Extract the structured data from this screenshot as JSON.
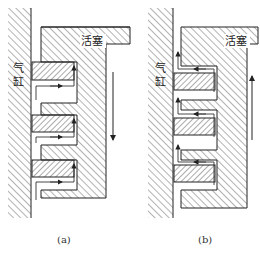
{
  "figure": {
    "colors": {
      "line": "#222222",
      "hatch": "#555555",
      "background": "#ffffff"
    },
    "panels": [
      {
        "id": "a",
        "caption": "(a)",
        "cylinder_label": "气\n缸",
        "cylinder_label_line1": "气",
        "cylinder_label_line2": "缸",
        "piston_label": "活塞",
        "motion": "down",
        "ring_position": "top-of-groove"
      },
      {
        "id": "b",
        "caption": "(b)",
        "cylinder_label_line1": "气",
        "cylinder_label_line2": "缸",
        "piston_label": "活塞",
        "motion": "up",
        "ring_position": "bottom-of-groove"
      }
    ]
  }
}
